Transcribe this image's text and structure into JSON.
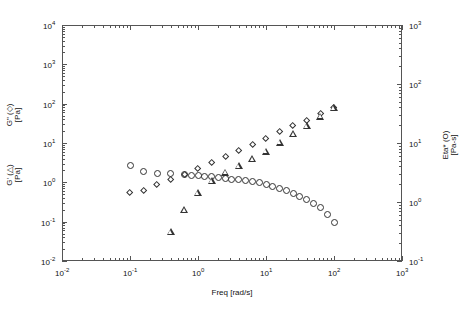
{
  "chart_data": {
    "type": "scatter",
    "title": "",
    "xlabel": "Freq [rad/s]",
    "ylabel_left_primary": "G\" (◇) [Pa]",
    "ylabel_left_secondary": "G' (△) [Pa]",
    "ylabel_right": "Eta* (○) [Pa·s]",
    "xscale": "log",
    "yscale": "log",
    "xlim": [
      0.01,
      1000
    ],
    "ylim_left": [
      0.01,
      10000
    ],
    "ylim_right": [
      0.1,
      1000
    ],
    "grid": false,
    "legend": "none",
    "x_tick_labels": [
      "10-2",
      "10-1",
      "100",
      "101",
      "102",
      "103"
    ],
    "x_tick_values": [
      0.01,
      0.1,
      1,
      10,
      100,
      1000
    ],
    "y_left_tick_labels": [
      "10-2",
      "10-1",
      "100",
      "101",
      "102",
      "103",
      "104"
    ],
    "y_left_tick_values": [
      0.01,
      0.1,
      1,
      10,
      100,
      1000,
      10000
    ],
    "y_right_tick_labels": [
      "10-1",
      "100",
      "101",
      "102",
      "103"
    ],
    "y_right_tick_values": [
      0.1,
      1,
      10,
      100,
      1000
    ],
    "series": [
      {
        "name": "Eta* (O)",
        "marker": "circle",
        "axis": "right",
        "x": [
          0.1,
          0.158,
          0.251,
          0.398,
          0.631,
          0.794,
          1.0,
          1.26,
          1.585,
          2.0,
          2.512,
          3.162,
          3.98,
          5.012,
          6.31,
          7.94,
          10.0,
          12.6,
          15.85,
          20.0,
          25.1,
          31.6,
          39.8,
          50.1,
          63.1,
          79.4,
          100.0
        ],
        "y": [
          4.2,
          3.3,
          3.1,
          3.0,
          2.9,
          2.8,
          2.8,
          2.75,
          2.7,
          2.6,
          2.5,
          2.45,
          2.4,
          2.3,
          2.2,
          2.1,
          2.0,
          1.85,
          1.7,
          1.55,
          1.4,
          1.25,
          1.1,
          0.95,
          0.8,
          0.62,
          0.45
        ]
      },
      {
        "name": "G\" (diamond)",
        "marker": "diamond",
        "axis": "left",
        "x": [
          0.1,
          0.158,
          0.251,
          0.398,
          0.631,
          1.0,
          1.585,
          2.512,
          3.98,
          6.31,
          10.0,
          15.85,
          25.1,
          39.8,
          63.1,
          100.0
        ],
        "y": [
          0.55,
          0.63,
          0.85,
          1.15,
          1.55,
          2.2,
          3.2,
          4.5,
          6.3,
          9.0,
          13.0,
          19.0,
          27.0,
          38.0,
          55.0,
          80.0
        ]
      },
      {
        "name": "G' (triangle)",
        "marker": "triangle",
        "axis": "left",
        "x": [
          0.398,
          0.631,
          1.0,
          1.585,
          2.512,
          3.98,
          6.31,
          10.0,
          15.85,
          25.1,
          39.8,
          63.1,
          100.0
        ],
        "y": [
          0.055,
          0.2,
          0.55,
          1.1,
          1.8,
          2.6,
          3.9,
          6.2,
          10.5,
          17.0,
          28.0,
          48.0,
          80.0
        ]
      }
    ]
  },
  "axis_labels": {
    "x_title": "Freq [rad/s]",
    "y_left_upper_line1": "G\" (◇)",
    "y_left_upper_line2": "[Pa]",
    "y_left_lower_line1": "G' (△)",
    "y_left_lower_line2": "[Pa]",
    "y_right_line1": "Eta* (O)",
    "y_right_line2": "[Pa-s]"
  },
  "ticks": {
    "x": [
      {
        "label_mantissa": "10",
        "label_exp": "-2"
      },
      {
        "label_mantissa": "10",
        "label_exp": "-1"
      },
      {
        "label_mantissa": "10",
        "label_exp": "0"
      },
      {
        "label_mantissa": "10",
        "label_exp": "1"
      },
      {
        "label_mantissa": "10",
        "label_exp": "2"
      },
      {
        "label_mantissa": "10",
        "label_exp": "3"
      }
    ],
    "y_left": [
      {
        "label_mantissa": "10",
        "label_exp": "4"
      },
      {
        "label_mantissa": "10",
        "label_exp": "3"
      },
      {
        "label_mantissa": "10",
        "label_exp": "2"
      },
      {
        "label_mantissa": "10",
        "label_exp": "1"
      },
      {
        "label_mantissa": "10",
        "label_exp": "0"
      },
      {
        "label_mantissa": "10",
        "label_exp": "-1"
      },
      {
        "label_mantissa": "10",
        "label_exp": "-2"
      }
    ],
    "y_right": [
      {
        "label_mantissa": "10",
        "label_exp": "3"
      },
      {
        "label_mantissa": "10",
        "label_exp": "2"
      },
      {
        "label_mantissa": "10",
        "label_exp": "1"
      },
      {
        "label_mantissa": "10",
        "label_exp": "0"
      },
      {
        "label_mantissa": "10",
        "label_exp": "-1"
      }
    ]
  },
  "colors": {
    "background": "#ffffff",
    "axis": "#555555",
    "marker": "#333333",
    "text": "#111111"
  }
}
